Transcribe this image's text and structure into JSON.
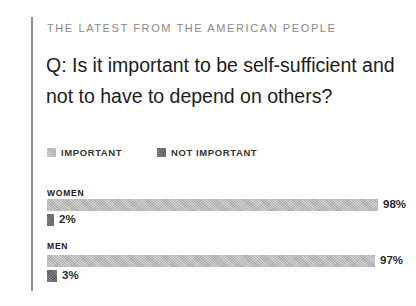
{
  "header": {
    "kicker": "THE LATEST FROM THE AMERICAN PEOPLE",
    "question": "Q: Is it important to be self-sufficient and not to have to depend on others?"
  },
  "legend": [
    {
      "label": "IMPORTANT",
      "color": "#b8b8b8"
    },
    {
      "label": "NOT IMPORTANT",
      "color": "#6a6a6a"
    }
  ],
  "groups": [
    {
      "label": "WOMEN",
      "important": 98,
      "important_label": "98%",
      "not_important": 2,
      "not_important_label": "2%"
    },
    {
      "label": "MEN",
      "important": 97,
      "important_label": "97%",
      "not_important": 3,
      "not_important_label": "3%"
    }
  ],
  "chart_data": {
    "type": "bar",
    "orientation": "horizontal",
    "title": "Q: Is it important to be self-sufficient and not to have to depend on others?",
    "subtitle": "THE LATEST FROM THE AMERICAN PEOPLE",
    "categories": [
      "WOMEN",
      "MEN"
    ],
    "series": [
      {
        "name": "IMPORTANT",
        "values": [
          98,
          97
        ],
        "color": "#b8b8b8"
      },
      {
        "name": "NOT IMPORTANT",
        "values": [
          2,
          3
        ],
        "color": "#6a6a6a"
      }
    ],
    "unit": "%",
    "xlim": [
      0,
      100
    ],
    "grid": false,
    "legend_position": "top-left",
    "xlabel": "",
    "ylabel": ""
  }
}
